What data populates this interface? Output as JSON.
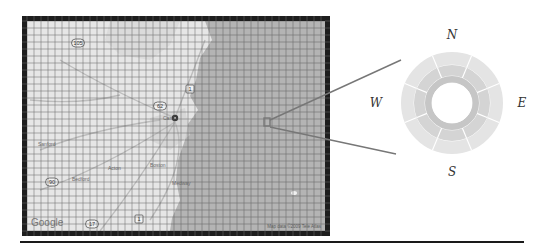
{
  "figure": {
    "type": "map-with-polar-sector-diagram",
    "map": {
      "frame": {
        "x": 22,
        "y": 16,
        "width": 308,
        "height": 220,
        "border_color": "#1e1e1e",
        "border_width": 5
      },
      "grid": {
        "cell_size": 7,
        "line_color": "#555555"
      },
      "colors": {
        "land": "#e6e6e6",
        "sea": "#b4b4b4",
        "roads": "#bdbdbd"
      },
      "attribution_logo": "Google",
      "attribution_text": "Map data ©2009 Tele Atlas",
      "route_shields": [
        {
          "label": "105",
          "x": 78,
          "y": 43
        },
        {
          "label": "1",
          "x": 190,
          "y": 89
        },
        {
          "label": "62",
          "x": 160,
          "y": 106
        },
        {
          "label": "90",
          "x": 52,
          "y": 182
        },
        {
          "label": "17",
          "x": 92,
          "y": 224
        },
        {
          "label": "1",
          "x": 139,
          "y": 219
        }
      ],
      "place_labels": [
        {
          "text": "Cam",
          "x": 163,
          "y": 120
        },
        {
          "text": "Sanford",
          "x": 38,
          "y": 146
        },
        {
          "text": "Bedford",
          "x": 72,
          "y": 181
        },
        {
          "text": "Acton",
          "x": 108,
          "y": 170
        },
        {
          "text": "Boston",
          "x": 150,
          "y": 167
        },
        {
          "text": "Medway",
          "x": 172,
          "y": 185
        }
      ],
      "marker": {
        "x": 175,
        "y": 118
      },
      "highlight_cell": {
        "x": 264,
        "y": 118,
        "width": 6,
        "height": 8,
        "stroke": "#777777"
      }
    },
    "leader_lines": [
      {
        "from": [
          270,
          120
        ],
        "to": [
          401,
          60
        ]
      },
      {
        "from": [
          270,
          127
        ],
        "to": [
          396,
          154
        ]
      }
    ],
    "polar_diagram": {
      "center": [
        452,
        103
      ],
      "rings": [
        {
          "name": "outer",
          "r_outer": 51,
          "r_inner": 38,
          "color": "#e4e4e4",
          "sectors": 8
        },
        {
          "name": "middle",
          "r_outer": 38,
          "r_inner": 27,
          "color": "#d4d4d4",
          "sectors": 8
        },
        {
          "name": "inner",
          "r_outer": 27,
          "r_inner": 20,
          "color": "#c6c6c6",
          "sectors": 1
        }
      ],
      "separator_color": "#ffffff",
      "directions": {
        "north": "N",
        "east": "E",
        "south": "S",
        "west": "W"
      }
    }
  }
}
